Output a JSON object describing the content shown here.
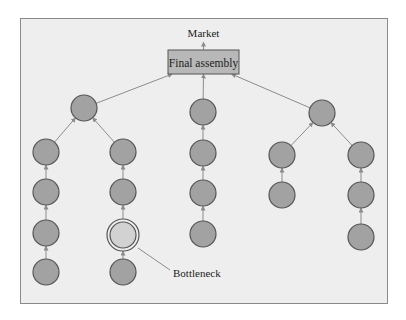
{
  "diagram": {
    "market_label": "Market",
    "final_assembly_label": "Final assembly",
    "bottleneck_label": "Bottleneck",
    "colors": {
      "frame_bg": "#eeeeee",
      "node_fill": "#a2a2a2",
      "node_stroke": "#555555",
      "bottleneck_fill": "#d2d2d2",
      "box_fill": "#b8b8b8",
      "edge": "#8c8c8c"
    },
    "nodes": [
      {
        "id": "L",
        "x": 84,
        "y": 108
      },
      {
        "id": "L1a",
        "x": 46,
        "y": 152
      },
      {
        "id": "L1b",
        "x": 46,
        "y": 192
      },
      {
        "id": "L1c",
        "x": 46,
        "y": 233
      },
      {
        "id": "L1d",
        "x": 46,
        "y": 272
      },
      {
        "id": "L2a",
        "x": 123,
        "y": 152
      },
      {
        "id": "L2b",
        "x": 123,
        "y": 192
      },
      {
        "id": "L2c",
        "x": 123,
        "y": 235,
        "bottleneck": true
      },
      {
        "id": "L2d",
        "x": 123,
        "y": 272
      },
      {
        "id": "C1",
        "x": 203,
        "y": 112
      },
      {
        "id": "C2",
        "x": 203,
        "y": 153
      },
      {
        "id": "C3",
        "x": 203,
        "y": 193
      },
      {
        "id": "C4",
        "x": 203,
        "y": 234
      },
      {
        "id": "R",
        "x": 322,
        "y": 113
      },
      {
        "id": "R1a",
        "x": 282,
        "y": 155
      },
      {
        "id": "R1b",
        "x": 282,
        "y": 195
      },
      {
        "id": "R2a",
        "x": 361,
        "y": 155
      },
      {
        "id": "R2b",
        "x": 361,
        "y": 195
      },
      {
        "id": "R2c",
        "x": 361,
        "y": 237
      }
    ],
    "edges": [
      [
        "L1d",
        "L1c"
      ],
      [
        "L1c",
        "L1b"
      ],
      [
        "L1b",
        "L1a"
      ],
      [
        "L1a",
        "L"
      ],
      [
        "L2d",
        "L2c"
      ],
      [
        "L2c",
        "L2b"
      ],
      [
        "L2b",
        "L2a"
      ],
      [
        "L2a",
        "L"
      ],
      [
        "C4",
        "C3"
      ],
      [
        "C3",
        "C2"
      ],
      [
        "C2",
        "C1"
      ],
      [
        "R1b",
        "R1a"
      ],
      [
        "R1a",
        "R"
      ],
      [
        "R2c",
        "R2b"
      ],
      [
        "R2b",
        "R2a"
      ],
      [
        "R2a",
        "R"
      ],
      [
        "L",
        "BOX"
      ],
      [
        "C1",
        "BOX"
      ],
      [
        "R",
        "BOX"
      ],
      [
        "BOX",
        "MARKET"
      ]
    ]
  }
}
